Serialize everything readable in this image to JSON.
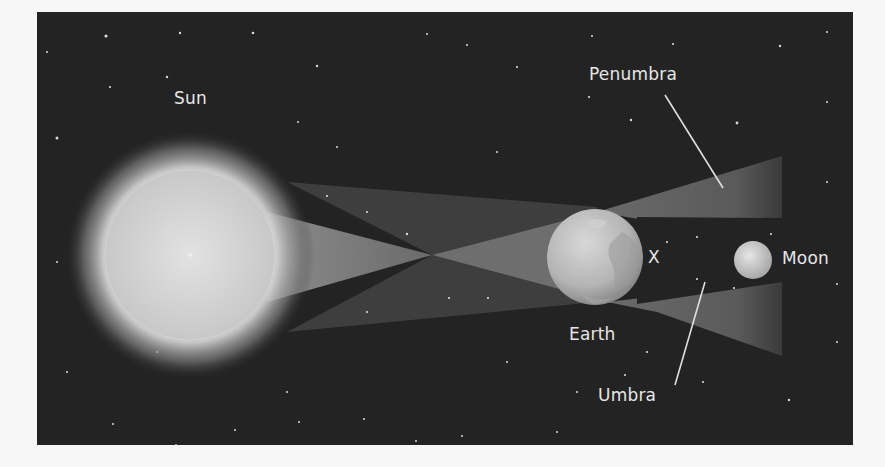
{
  "diagram": {
    "type": "lunar-eclipse-shadow-diagram",
    "labels": {
      "sun": "Sun",
      "penumbra": "Penumbra",
      "earth": "Earth",
      "x_marker": "X",
      "moon": "Moon",
      "umbra": "Umbra"
    },
    "colors": {
      "background": "#232323",
      "page": "#f7f7f7",
      "label_text": "#e6e6e6",
      "penumbra_fill": "#5a5a5a",
      "umbra_region": "#232323",
      "sun_core": "#d4d4d4"
    }
  }
}
